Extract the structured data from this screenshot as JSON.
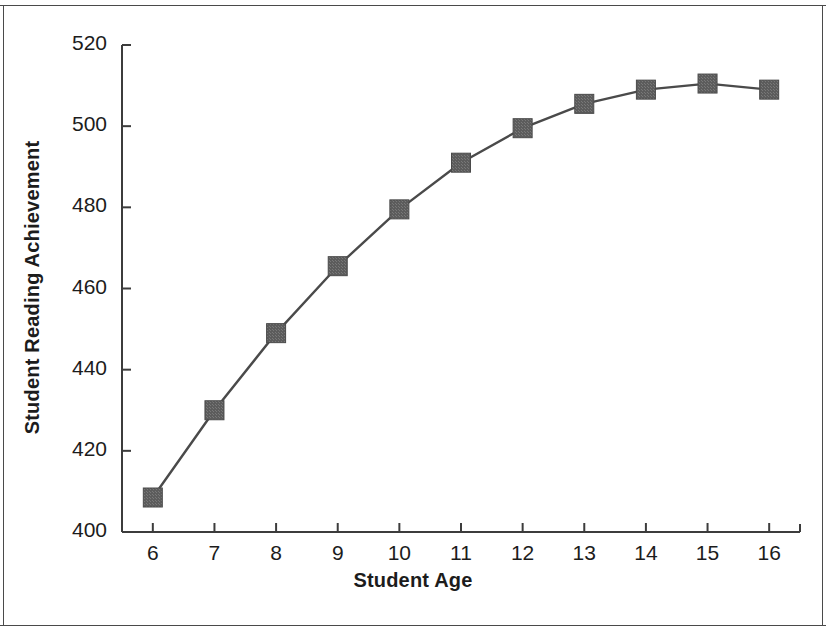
{
  "figure": {
    "background_color": "#ffffff",
    "frame_color": "#4a4a4a"
  },
  "chart_data": {
    "type": "line",
    "title": "",
    "xlabel": "Student Age",
    "ylabel": "Student Reading Achievement",
    "x": [
      6,
      7,
      8,
      9,
      10,
      11,
      12,
      13,
      14,
      15,
      16
    ],
    "xticklabels": [
      "6",
      "7",
      "8",
      "9",
      "10",
      "11",
      "12",
      "13",
      "14",
      "15",
      "16"
    ],
    "values": [
      408.5,
      430,
      449,
      465.5,
      479.5,
      491,
      499.5,
      505.5,
      509,
      510.5,
      509
    ],
    "yticks": [
      400,
      420,
      440,
      460,
      480,
      500,
      520
    ],
    "yticklabels": [
      "400",
      "420",
      "440",
      "460",
      "480",
      "500",
      "520"
    ],
    "xlim": [
      5.5,
      16.5
    ],
    "ylim": [
      400,
      520
    ],
    "grid": false,
    "legend": null,
    "series": [
      {
        "name": "Student Reading Achievement",
        "marker": "square",
        "marker_color": "#575757",
        "line_color": "#4a4a4a",
        "values": [
          408.5,
          430,
          449,
          465.5,
          479.5,
          491,
          499.5,
          505.5,
          509,
          510.5,
          509
        ]
      }
    ]
  }
}
